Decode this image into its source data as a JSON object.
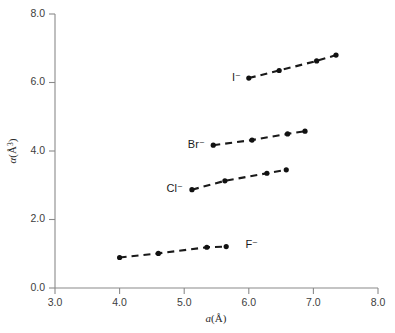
{
  "chart_data": {
    "type": "scatter",
    "title": "",
    "xlabel": "a(Å)",
    "ylabel": "α(Å³)",
    "xlim": [
      3.0,
      8.0
    ],
    "ylim": [
      0.0,
      8.0
    ],
    "xticks": [
      "3.0",
      "4.0",
      "5.0",
      "6.0",
      "7.0",
      "8.0"
    ],
    "yticks": [
      "0.0",
      "2.0",
      "4.0",
      "6.0",
      "8.0"
    ],
    "xtick_values": [
      3.0,
      4.0,
      5.0,
      6.0,
      7.0,
      8.0
    ],
    "ytick_values": [
      0.0,
      2.0,
      4.0,
      6.0,
      8.0
    ],
    "grid": false,
    "legend": "inline-annotations",
    "line_style": "dashed",
    "marker": "filled-circle",
    "series": [
      {
        "name": "F−",
        "label": "F⁻",
        "label_anchor": "start",
        "label_x": 5.95,
        "label_y": 1.25,
        "x": [
          4.0,
          4.6,
          5.35,
          5.65
        ],
        "y": [
          0.89,
          1.01,
          1.19,
          1.21
        ]
      },
      {
        "name": "Cl−",
        "label": "Cl⁻",
        "label_anchor": "end",
        "label_x": 4.98,
        "label_y": 2.88,
        "x": [
          5.12,
          5.63,
          6.28,
          6.58
        ],
        "y": [
          2.87,
          3.13,
          3.35,
          3.45
        ]
      },
      {
        "name": "Br−",
        "label": "Br⁻",
        "label_anchor": "end",
        "label_x": 5.32,
        "label_y": 4.17,
        "x": [
          5.45,
          6.05,
          6.6,
          6.87
        ],
        "y": [
          4.17,
          4.32,
          4.5,
          4.58
        ]
      },
      {
        "name": "I−",
        "label": "I⁻",
        "label_anchor": "end",
        "label_x": 5.88,
        "label_y": 6.13,
        "x": [
          6.0,
          6.47,
          7.05,
          7.35
        ],
        "y": [
          6.13,
          6.35,
          6.63,
          6.8
        ]
      }
    ]
  },
  "colors": {
    "axis": "#8a8a8a",
    "tick_text": "#3d3d3d",
    "data": "#111111",
    "background": "#ffffff"
  }
}
